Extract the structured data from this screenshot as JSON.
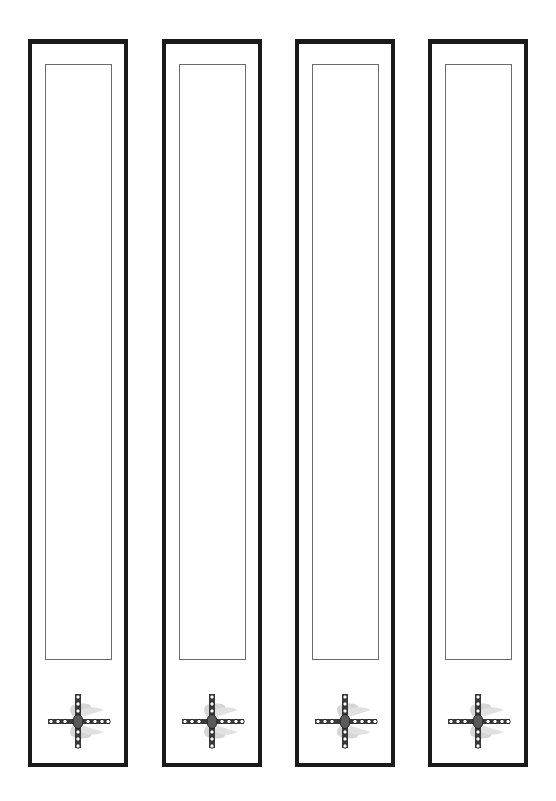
{
  "page": {
    "background_color": "#ffffff"
  },
  "bookmarks": [
    {
      "index": 1,
      "frame_color": "#1a1a1a",
      "text_area_color": "#6b6b6b",
      "emblem": "winged-jeweled-cross",
      "left_px": 28
    },
    {
      "index": 2,
      "frame_color": "#1a1a1a",
      "text_area_color": "#6b6b6b",
      "emblem": "winged-jeweled-cross",
      "left_px": 162
    },
    {
      "index": 3,
      "frame_color": "#1a1a1a",
      "text_area_color": "#6b6b6b",
      "emblem": "winged-jeweled-cross",
      "left_px": 295
    },
    {
      "index": 4,
      "frame_color": "#1a1a1a",
      "text_area_color": "#6b6b6b",
      "emblem": "winged-jeweled-cross",
      "left_px": 428
    }
  ]
}
